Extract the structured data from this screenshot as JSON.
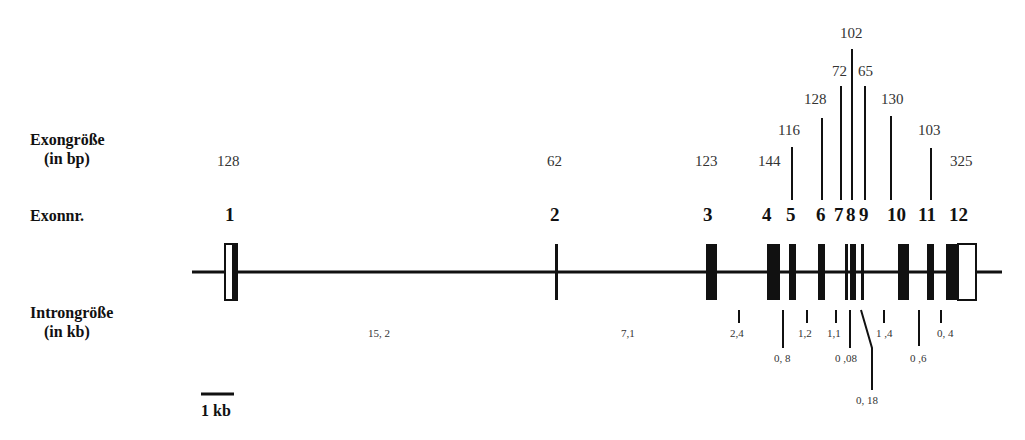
{
  "labels": {
    "exon_size": "Exongröße",
    "exon_size_unit": "(in bp)",
    "exon_number": "Exonnr.",
    "intron_size": "Introngröße",
    "intron_size_unit": "(in kb)",
    "scale_bar": "1 kb"
  },
  "colors": {
    "ink": "#111111",
    "coding": "#000000",
    "utr": "#ffffff"
  },
  "exons": [
    {
      "number": "1",
      "size_bp": "128"
    },
    {
      "number": "2",
      "size_bp": "62"
    },
    {
      "number": "3",
      "size_bp": "123"
    },
    {
      "number": "4",
      "size_bp": "144"
    },
    {
      "number": "5",
      "size_bp": "116"
    },
    {
      "number": "6",
      "size_bp": "128"
    },
    {
      "number": "7",
      "size_bp": "72"
    },
    {
      "number": "8",
      "size_bp": "102"
    },
    {
      "number": "9",
      "size_bp": "65"
    },
    {
      "number": "10",
      "size_bp": "130"
    },
    {
      "number": "11",
      "size_bp": "103"
    },
    {
      "number": "12",
      "size_bp": "325"
    }
  ],
  "introns": [
    {
      "between": "1-2",
      "size_kb": "15, 2"
    },
    {
      "between": "2-3",
      "size_kb": "7,1"
    },
    {
      "between": "3-4",
      "size_kb": "2,4"
    },
    {
      "between": "4-5",
      "size_kb": "0, 8"
    },
    {
      "between": "5-6",
      "size_kb": "1,2"
    },
    {
      "between": "6-7",
      "size_kb": "1,1"
    },
    {
      "between": "7-8",
      "size_kb": "0 ,08"
    },
    {
      "between": "8-9",
      "size_kb": "0, 18"
    },
    {
      "between": "9-10",
      "size_kb": "1 ,4"
    },
    {
      "between": "10-11",
      "size_kb": "0 ,6"
    },
    {
      "between": "11-12",
      "size_kb": "0, 4"
    }
  ]
}
